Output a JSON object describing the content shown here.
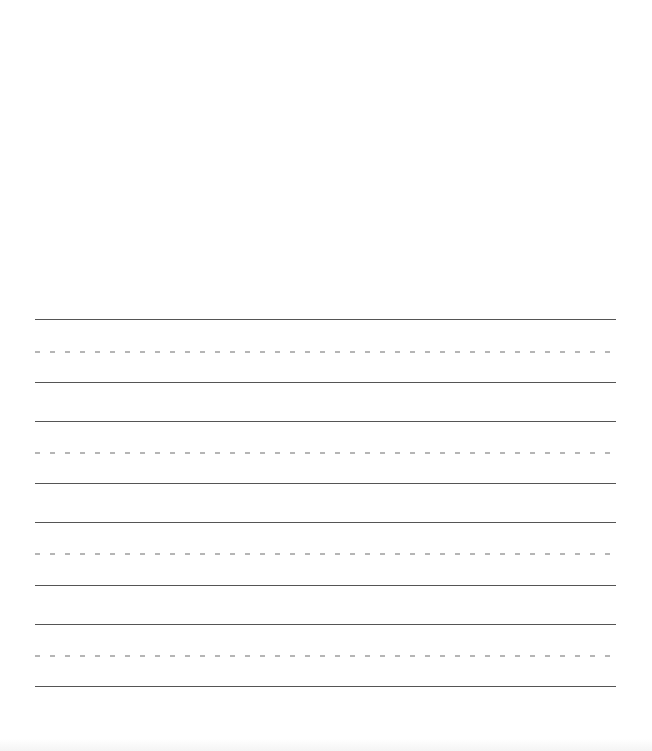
{
  "document": {
    "type": "handwriting-practice-sheet",
    "background": "#ffffff",
    "line_color": "#555555",
    "midline_color": "#b5b5b5",
    "line_groups": [
      {
        "top_y": 320,
        "mid_y": 352,
        "base_y": 383
      },
      {
        "top_y": 422,
        "mid_y": 453,
        "base_y": 484
      },
      {
        "top_y": 523,
        "mid_y": 554,
        "base_y": 586
      },
      {
        "top_y": 625,
        "mid_y": 656,
        "base_y": 687
      }
    ]
  }
}
